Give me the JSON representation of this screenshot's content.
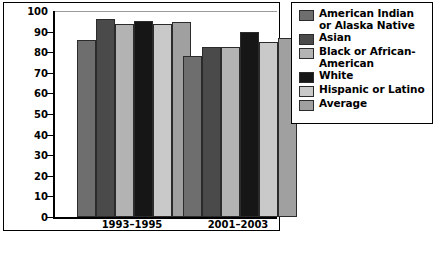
{
  "chart_data": {
    "type": "bar",
    "title": "",
    "xlabel": "",
    "ylabel": "Percentage",
    "categories": [
      "1993–1995",
      "2001–2003"
    ],
    "ylim": [
      0,
      100
    ],
    "yticks": [
      0,
      10,
      20,
      30,
      40,
      50,
      60,
      70,
      80,
      90,
      100
    ],
    "grid": false,
    "legend_position": "right",
    "series": [
      {
        "name": "American Indian or Alaska Native",
        "color": "#6e6e6e",
        "values": [
          86,
          78
        ]
      },
      {
        "name": "Asian",
        "color": "#4a4a4a",
        "values": [
          96,
          82.5
        ]
      },
      {
        "name": "Black or African-American",
        "color": "#b3b3b3",
        "values": [
          93.5,
          82.5
        ]
      },
      {
        "name": "White",
        "color": "#161616",
        "values": [
          95,
          90
        ]
      },
      {
        "name": "Hispanic or Latino",
        "color": "#c9c9c9",
        "values": [
          93.5,
          85
        ]
      },
      {
        "name": "Average",
        "color": "#a0a0a0",
        "values": [
          94.5,
          87
        ]
      }
    ]
  },
  "axis": {
    "ylabel": "Percentage",
    "tick_labels": [
      "100",
      "90",
      "80",
      "70",
      "60",
      "50",
      "40",
      "30",
      "20",
      "10",
      "0"
    ],
    "category_labels": [
      "1993–1995",
      "2001–2003"
    ]
  },
  "legend": {
    "items": [
      {
        "label": "American Indian or Alaska Native",
        "color": "#6e6e6e"
      },
      {
        "label": "Asian",
        "color": "#4a4a4a"
      },
      {
        "label": "Black or African-American",
        "color": "#b3b3b3"
      },
      {
        "label": "White",
        "color": "#161616"
      },
      {
        "label": "Hispanic or Latino",
        "color": "#c9c9c9"
      },
      {
        "label": "Average",
        "color": "#a0a0a0"
      }
    ]
  }
}
